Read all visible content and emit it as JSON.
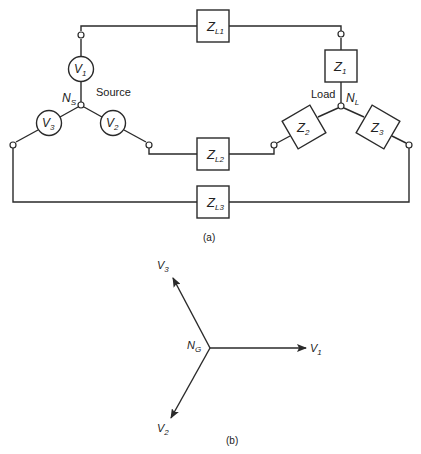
{
  "figure": {
    "part_a": {
      "caption": "(a)",
      "source": {
        "label": "Source",
        "neutral": {
          "main": "N",
          "sub": "S"
        },
        "sources": [
          {
            "id": "V1",
            "main": "V",
            "sub": "1"
          },
          {
            "id": "V2",
            "main": "V",
            "sub": "2"
          },
          {
            "id": "V3",
            "main": "V",
            "sub": "3"
          }
        ]
      },
      "lines": [
        {
          "id": "ZL1",
          "main": "Z",
          "sub": "L1"
        },
        {
          "id": "ZL2",
          "main": "Z",
          "sub": "L2"
        },
        {
          "id": "ZL3",
          "main": "Z",
          "sub": "L3"
        }
      ],
      "load": {
        "label": "Load",
        "neutral": {
          "main": "N",
          "sub": "L"
        },
        "impedances": [
          {
            "id": "Z1",
            "main": "Z",
            "sub": "1"
          },
          {
            "id": "Z2",
            "main": "Z",
            "sub": "2"
          },
          {
            "id": "Z3",
            "main": "Z",
            "sub": "3"
          }
        ]
      }
    },
    "part_b": {
      "caption": "(b)",
      "origin": {
        "main": "N",
        "sub": "G"
      },
      "phasors": [
        {
          "id": "V1",
          "main": "V",
          "sub": "1",
          "angle_deg": 0
        },
        {
          "id": "V2",
          "main": "V",
          "sub": "2",
          "angle_deg": 240
        },
        {
          "id": "V3",
          "main": "V",
          "sub": "3",
          "angle_deg": 120
        }
      ]
    }
  }
}
